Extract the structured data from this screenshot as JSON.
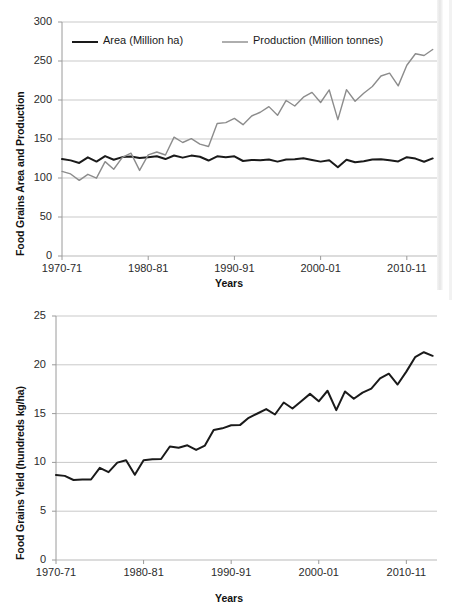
{
  "chart_data": [
    {
      "id": "food-grains-area-production",
      "type": "line",
      "title": "",
      "xlabel": "Years",
      "ylabel": "Food Grains Area and Production",
      "ylim": [
        0,
        300
      ],
      "yticks": [
        0,
        50,
        100,
        150,
        200,
        250,
        300
      ],
      "xticks": [
        "1970-71",
        "1980-81",
        "1990-91",
        "2000-01",
        "2010-11"
      ],
      "xtick_years": [
        1970,
        1980,
        1990,
        2000,
        2010
      ],
      "grid": "horizontal",
      "legend_position": "top-inside",
      "x": [
        1970,
        1971,
        1972,
        1973,
        1974,
        1975,
        1976,
        1977,
        1978,
        1979,
        1980,
        1981,
        1982,
        1983,
        1984,
        1985,
        1986,
        1987,
        1988,
        1989,
        1990,
        1991,
        1992,
        1993,
        1994,
        1995,
        1996,
        1997,
        1998,
        1999,
        2000,
        2001,
        2002,
        2003,
        2004,
        2005,
        2006,
        2007,
        2008,
        2009,
        2010,
        2011,
        2012,
        2013
      ],
      "series": [
        {
          "name": "Area (Million ha)",
          "color": "#1a1a1a",
          "width": 2.0,
          "values": [
            124.3,
            122.6,
            119.3,
            126.5,
            121.1,
            128.1,
            123.4,
            126.8,
            127.5,
            125.6,
            126.7,
            127.8,
            124.3,
            128.9,
            126.1,
            128.7,
            127.2,
            122.4,
            127.8,
            126.6,
            127.8,
            121.8,
            123.2,
            122.9,
            123.8,
            121.0,
            123.6,
            124.0,
            125.4,
            123.2,
            121.0,
            122.8,
            113.9,
            123.5,
            120.1,
            121.6,
            123.7,
            124.0,
            122.8,
            121.3,
            126.7,
            124.9,
            120.8,
            125.1
          ]
        },
        {
          "name": "Production (Million tonnes)",
          "color": "#8c8c8c",
          "width": 1.4,
          "values": [
            108.4,
            105.2,
            97.0,
            104.7,
            99.8,
            121.0,
            111.2,
            126.4,
            131.9,
            109.7,
            129.6,
            133.3,
            129.5,
            152.4,
            145.5,
            150.4,
            143.4,
            140.4,
            169.9,
            171.0,
            176.4,
            168.4,
            179.5,
            184.3,
            191.5,
            180.4,
            199.4,
            192.3,
            203.6,
            209.8,
            196.8,
            212.9,
            174.8,
            213.2,
            198.4,
            208.6,
            217.3,
            230.8,
            234.5,
            218.1,
            244.5,
            259.3,
            257.1,
            264.8
          ]
        }
      ]
    },
    {
      "id": "food-grains-yield",
      "type": "line",
      "title": "",
      "xlabel": "Years",
      "ylabel": "Food Grains Yield (hundreds kg/ha)",
      "ylim": [
        0,
        25
      ],
      "yticks": [
        0,
        5,
        10,
        15,
        20,
        25
      ],
      "xticks": [
        "1970-71",
        "1980-81",
        "1990-91",
        "2000-01",
        "2010-11"
      ],
      "xtick_years": [
        1970,
        1980,
        1990,
        2000,
        2010
      ],
      "grid": "horizontal",
      "legend_position": "none",
      "x": [
        1970,
        1971,
        1972,
        1973,
        1974,
        1975,
        1976,
        1977,
        1978,
        1979,
        1980,
        1981,
        1982,
        1983,
        1984,
        1985,
        1986,
        1987,
        1988,
        1989,
        1990,
        1991,
        1992,
        1993,
        1994,
        1995,
        1996,
        1997,
        1998,
        1999,
        2000,
        2001,
        2002,
        2003,
        2004,
        2005,
        2006,
        2007,
        2008,
        2009,
        2010,
        2011,
        2012,
        2013
      ],
      "series": [
        {
          "name": "Food Grains Yield (hundreds kg/ha)",
          "color": "#1a1a1a",
          "width": 2.0,
          "values": [
            8.72,
            8.62,
            8.2,
            8.25,
            8.25,
            9.44,
            9.0,
            9.98,
            10.22,
            8.73,
            10.23,
            10.31,
            10.35,
            11.63,
            11.5,
            11.75,
            11.28,
            11.73,
            13.31,
            13.49,
            13.8,
            13.82,
            14.57,
            15.01,
            15.46,
            14.91,
            16.14,
            15.52,
            16.27,
            17.02,
            16.26,
            17.34,
            15.35,
            17.27,
            16.52,
            17.15,
            17.56,
            18.6,
            19.09,
            17.98,
            19.3,
            20.78,
            21.29,
            20.92
          ]
        }
      ]
    }
  ]
}
